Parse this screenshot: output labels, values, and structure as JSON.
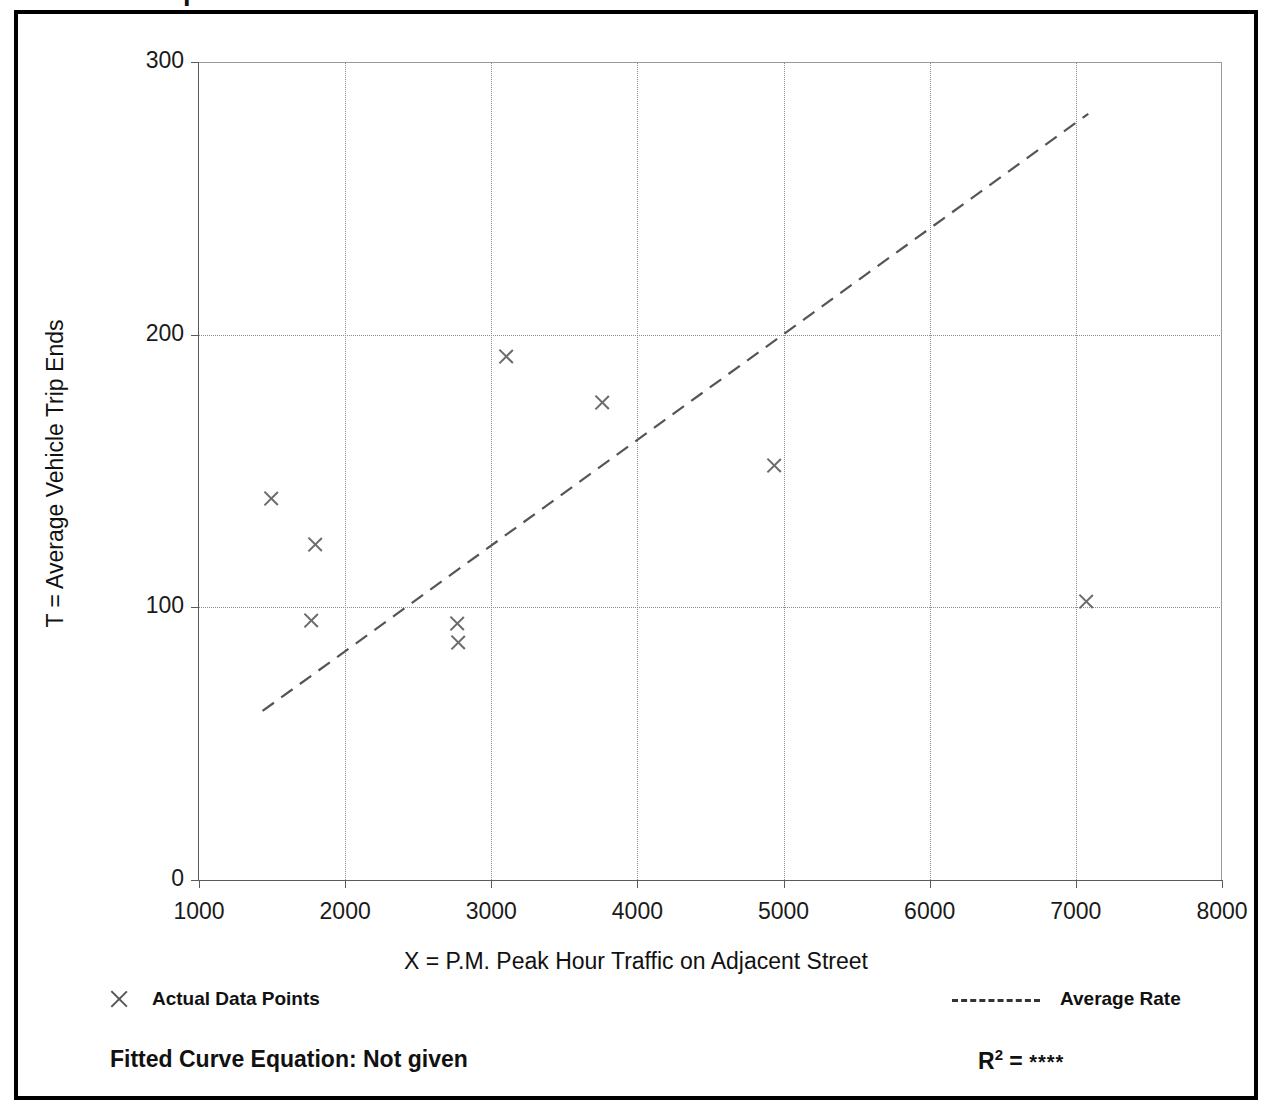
{
  "page": {
    "title": "ot and Equation",
    "title_note_clipped": true
  },
  "legend": {
    "data_points_label": "Actual Data Points",
    "average_rate_label": "Average Rate",
    "marker_icon": "x-marker-icon",
    "line_icon": "dashed-line-icon"
  },
  "footer": {
    "equation_label": "Fitted Curve Equation:  Not given",
    "r2_label": "R",
    "r2_exponent": "2",
    "r2_equals": " = ",
    "r2_value": "****"
  },
  "chart_data": {
    "type": "scatter",
    "title": "",
    "xlabel": "X = P.M. Peak Hour Traffic on Adjacent Street",
    "ylabel": "T = Average Vehicle Trip Ends",
    "xlim": [
      1000,
      8000
    ],
    "ylim": [
      0,
      300
    ],
    "xticks": [
      1000,
      2000,
      3000,
      4000,
      5000,
      6000,
      7000,
      8000
    ],
    "xtick_labels": [
      "1000",
      "2000",
      "3000",
      "4000",
      "5000",
      "6000",
      "7000",
      "8000"
    ],
    "yticks": [
      0,
      100,
      200,
      300
    ],
    "ytick_labels": [
      "0",
      "100",
      "200",
      "300"
    ],
    "grid": true,
    "grid_style": "dotted",
    "legend_position": "below-plot",
    "series": [
      {
        "name": "Actual Data Points",
        "type": "scatter",
        "marker": "x",
        "color": "#6b6b6b",
        "points": [
          {
            "x": 1490,
            "y": 140
          },
          {
            "x": 1795,
            "y": 123
          },
          {
            "x": 1765,
            "y": 95
          },
          {
            "x": 2765,
            "y": 94
          },
          {
            "x": 2770,
            "y": 87
          },
          {
            "x": 3100,
            "y": 192
          },
          {
            "x": 3755,
            "y": 175
          },
          {
            "x": 4935,
            "y": 152
          },
          {
            "x": 7070,
            "y": 102
          }
        ]
      },
      {
        "name": "Average Rate",
        "type": "line",
        "style": "dashed",
        "color": "#555555",
        "endpoints": [
          {
            "x": 1435,
            "y": 62
          },
          {
            "x": 7085,
            "y": 281
          }
        ]
      }
    ]
  }
}
